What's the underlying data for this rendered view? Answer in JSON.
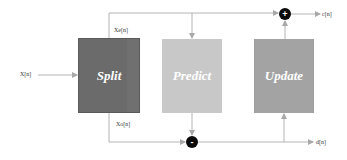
{
  "diagram": {
    "type": "lifting-scheme",
    "input": {
      "label": "X[n]"
    },
    "blocks": [
      {
        "id": "split",
        "label": "Split",
        "color": "#6b6b6b"
      },
      {
        "id": "predict",
        "label": "Predict",
        "color": "#c8c8c8"
      },
      {
        "id": "update",
        "label": "Update",
        "color": "#a3a3a3"
      }
    ],
    "signals": {
      "even": "Xe[n]",
      "odd": "Xo[n]"
    },
    "operators": {
      "plus": "+",
      "minus": "-"
    },
    "outputs": {
      "approx": "c[n]",
      "detail": "d[n]"
    },
    "edges": [
      {
        "from": "input",
        "to": "split"
      },
      {
        "from": "split",
        "to": "predict",
        "label": "Xe[n]"
      },
      {
        "from": "split",
        "to": "plus",
        "label": "Xe[n]"
      },
      {
        "from": "split",
        "to": "minus",
        "label": "Xo[n]"
      },
      {
        "from": "predict",
        "to": "minus"
      },
      {
        "from": "minus",
        "to": "detail_output"
      },
      {
        "from": "minus",
        "to": "update"
      },
      {
        "from": "update",
        "to": "plus"
      },
      {
        "from": "plus",
        "to": "approx_output"
      }
    ],
    "colors": {
      "wire": "#b0b0b0",
      "operator": "#0a0a0a"
    }
  }
}
